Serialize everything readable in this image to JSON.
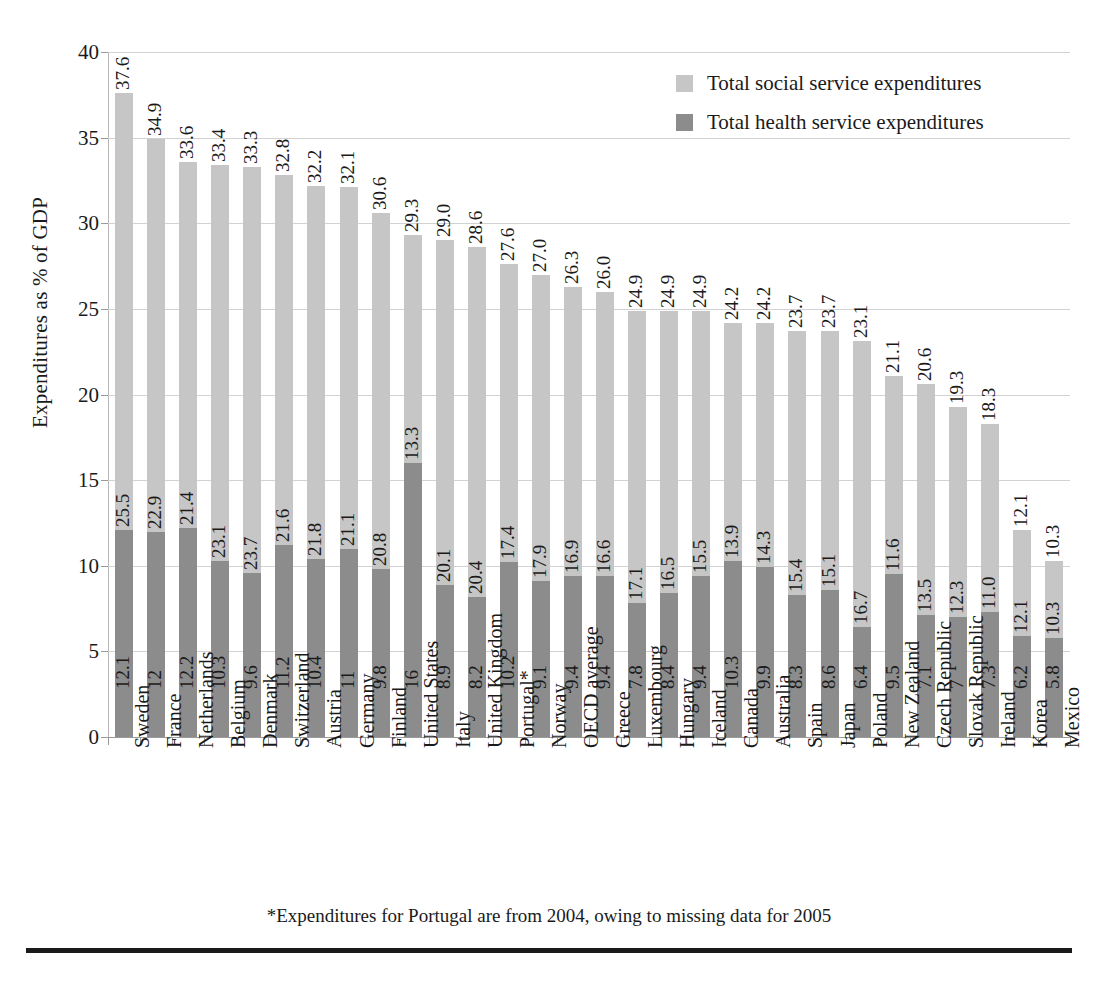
{
  "chart_data": {
    "type": "bar",
    "subtype": "stacked-vertical",
    "title": "",
    "xlabel": "",
    "ylabel": "Expenditures as % of GDP",
    "ylim": [
      0,
      40
    ],
    "yticks": [
      0,
      5,
      10,
      15,
      20,
      25,
      30,
      35,
      40
    ],
    "grid": true,
    "legend_position": "top-right",
    "categories": [
      "Sweden",
      "France",
      "Netherlands",
      "Belgium",
      "Denmark",
      "Switzerland",
      "Austria",
      "Germany",
      "Finland",
      "United States",
      "Italy",
      "United Kingdom",
      "Portugal*",
      "Norway",
      "OECD average",
      "Greece",
      "Luxembourg",
      "Hungary",
      "Iceland",
      "Canada",
      "Australia",
      "Spain",
      "Japan",
      "Poland",
      "New Zealand",
      "Czech Republic",
      "Slovak Republic",
      "Ireland",
      "Korea",
      "Mexico"
    ],
    "series": [
      {
        "name": "Total social service expenditures",
        "color": "#c6c6c6",
        "values": [
          25.5,
          22.9,
          21.4,
          23.1,
          23.7,
          21.6,
          21.8,
          21.1,
          20.8,
          13.3,
          20.1,
          20.4,
          17.4,
          17.9,
          16.9,
          16.6,
          17.1,
          16.5,
          15.5,
          13.9,
          14.3,
          15.4,
          15.1,
          16.7,
          11.6,
          13.5,
          12.3,
          11.0,
          6.2,
          4.5
        ]
      },
      {
        "name": "Total health service expenditures",
        "color": "#8c8c8c",
        "values": [
          12.1,
          12,
          12.2,
          10.3,
          9.6,
          11.2,
          10.4,
          11,
          9.8,
          16,
          8.9,
          8.2,
          10.2,
          9.1,
          9.4,
          9.4,
          7.8,
          8.4,
          9.4,
          10.3,
          9.9,
          8.3,
          8.6,
          6.4,
          9.5,
          7.1,
          7,
          7.3,
          5.9,
          5.8
        ]
      }
    ],
    "social_labels": [
      "25.5",
      "22.9",
      "21.4",
      "23.1",
      "23.7",
      "21.6",
      "21.8",
      "21.1",
      "20.8",
      "13.3",
      "20.1",
      "20.4",
      "17.4",
      "17.9",
      "16.9",
      "16.6",
      "17.1",
      "16.5",
      "15.5",
      "13.9",
      "14.3",
      "15.4",
      "15.1",
      "16.7",
      "11.6",
      "13.5",
      "12.3",
      "11.0",
      "12.1",
      "10.3"
    ],
    "health_labels": [
      "12.1",
      "12",
      "12.2",
      "10.3",
      "9.6",
      "11.2",
      "10.4",
      "11",
      "9.8",
      "16",
      "8.9",
      "8.2",
      "10.2",
      "9.1",
      "9.4",
      "9.4",
      "7.8",
      "8.4",
      "9.4",
      "10.3",
      "9.9",
      "8.3",
      "8.6",
      "6.4",
      "9.5",
      "7.1",
      "7",
      "7.3",
      "6.2",
      "5.8"
    ],
    "totals": [
      37.6,
      34.9,
      33.6,
      33.4,
      33.3,
      32.8,
      32.2,
      32.1,
      30.6,
      29.3,
      29.0,
      28.6,
      27.6,
      27.0,
      26.3,
      26.0,
      24.9,
      24.9,
      24.9,
      24.2,
      24.2,
      23.7,
      23.7,
      23.1,
      21.1,
      20.6,
      19.3,
      18.3,
      12.1,
      10.3
    ],
    "total_labels": [
      "37.6",
      "34.9",
      "33.6",
      "33.4",
      "33.3",
      "32.8",
      "32.2",
      "32.1",
      "30.6",
      "29.3",
      "29.0",
      "28.6",
      "27.6",
      "27.0",
      "26.3",
      "26.0",
      "24.9",
      "24.9",
      "24.9",
      "24.2",
      "24.2",
      "23.7",
      "23.7",
      "23.1",
      "21.1",
      "20.6",
      "19.3",
      "18.3",
      "12.1",
      "10.3"
    ]
  },
  "legend": {
    "items": [
      {
        "label": "Total social service expenditures",
        "color": "#c6c6c6"
      },
      {
        "label": "Total health service expenditures",
        "color": "#8c8c8c"
      }
    ]
  },
  "footnote": "*Expenditures for Portugal are from 2004, owing to missing data for 2005"
}
